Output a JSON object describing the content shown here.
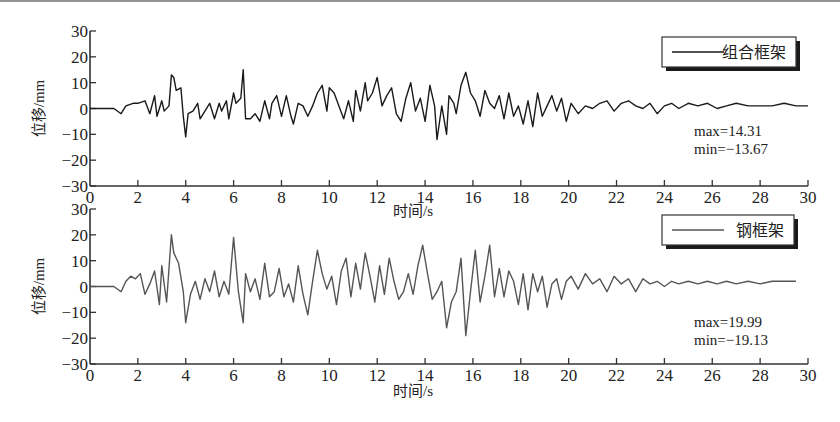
{
  "chart_data": [
    {
      "type": "line",
      "title": "",
      "legend": [
        "组合框架"
      ],
      "legend_position": "upper right",
      "xlabel": "时间/s",
      "ylabel": "位移/mm",
      "xlim": [
        0,
        30
      ],
      "ylim": [
        -30,
        30
      ],
      "xticks": [
        0,
        2,
        4,
        6,
        8,
        10,
        12,
        14,
        16,
        18,
        20,
        22,
        24,
        26,
        28,
        30
      ],
      "yticks": [
        -30,
        -20,
        -10,
        0,
        10,
        20,
        30
      ],
      "grid": false,
      "annotations": [
        "max=14.31",
        "min=-13.67"
      ],
      "series": [
        {
          "name": "组合框架",
          "color": "#1a1a1a",
          "x": [
            0,
            0.5,
            1.0,
            1.3,
            1.5,
            1.8,
            2.0,
            2.3,
            2.5,
            2.7,
            2.8,
            3.0,
            3.1,
            3.3,
            3.4,
            3.5,
            3.6,
            3.8,
            3.9,
            4.0,
            4.1,
            4.3,
            4.5,
            4.6,
            4.8,
            5.0,
            5.2,
            5.4,
            5.5,
            5.7,
            5.8,
            6.0,
            6.1,
            6.3,
            6.4,
            6.5,
            6.7,
            6.9,
            7.1,
            7.3,
            7.5,
            7.6,
            7.8,
            8.0,
            8.2,
            8.4,
            8.5,
            8.7,
            8.9,
            9.1,
            9.3,
            9.5,
            9.7,
            9.9,
            10.0,
            10.2,
            10.4,
            10.6,
            10.8,
            11.0,
            11.1,
            11.3,
            11.5,
            11.6,
            11.8,
            12.0,
            12.2,
            12.4,
            12.6,
            12.8,
            13.0,
            13.2,
            13.4,
            13.6,
            13.8,
            14.0,
            14.2,
            14.4,
            14.5,
            14.7,
            14.9,
            15.0,
            15.2,
            15.3,
            15.5,
            15.7,
            15.9,
            16.1,
            16.3,
            16.5,
            16.7,
            16.9,
            17.1,
            17.3,
            17.5,
            17.7,
            17.9,
            18.1,
            18.3,
            18.5,
            18.7,
            18.9,
            19.1,
            19.3,
            19.5,
            19.7,
            19.9,
            20.1,
            20.4,
            20.7,
            21.0,
            21.3,
            21.6,
            21.9,
            22.2,
            22.5,
            22.8,
            23.1,
            23.4,
            23.7,
            24.0,
            24.3,
            24.6,
            25.0,
            25.4,
            25.8,
            26.2,
            26.6,
            27.0,
            27.5,
            28.0,
            28.5,
            29.0,
            29.5,
            30.0
          ],
          "y": [
            0,
            0,
            0,
            -2,
            1,
            2,
            2,
            3,
            -2,
            5,
            -3,
            3,
            -1,
            1,
            13,
            12,
            7,
            8,
            -3,
            -11,
            -2,
            -1,
            2,
            -4,
            -1,
            2,
            -4,
            2,
            -1,
            3,
            -4,
            6,
            2,
            4,
            15,
            -4,
            -4,
            -2,
            -5,
            3,
            -4,
            2,
            5,
            -3,
            5,
            -3,
            -6,
            2,
            1,
            -3,
            1,
            6,
            9,
            -1,
            8,
            6,
            1,
            -4,
            3,
            -5,
            7,
            -1,
            10,
            3,
            6,
            12,
            1,
            5,
            8,
            -2,
            -5,
            4,
            10,
            -1,
            4,
            -5,
            9,
            1,
            -12,
            1,
            -10,
            5,
            2,
            -2,
            9,
            14,
            6,
            3,
            -3,
            7,
            2,
            0,
            5,
            -4,
            6,
            -3,
            1,
            -6,
            3,
            -7,
            6,
            -3,
            1,
            5,
            -1,
            4,
            -5,
            2,
            -2,
            1,
            0,
            2,
            3,
            -1,
            2,
            3,
            1,
            0,
            2,
            -2,
            1,
            2,
            0,
            2,
            1,
            2,
            0,
            1,
            2,
            1,
            1,
            1,
            2,
            1,
            1,
            2,
            2
          ]
        }
      ]
    },
    {
      "type": "line",
      "title": "",
      "legend": [
        "钢框架"
      ],
      "legend_position": "upper right",
      "xlabel": "时间/s",
      "ylabel": "位移/mm",
      "xlim": [
        0,
        30
      ],
      "ylim": [
        -30,
        30
      ],
      "xticks": [
        0,
        2,
        4,
        6,
        8,
        10,
        12,
        14,
        16,
        18,
        20,
        22,
        24,
        26,
        28,
        30
      ],
      "yticks": [
        -30,
        -20,
        -10,
        0,
        10,
        20,
        30
      ],
      "grid": false,
      "annotations": [
        "max=19.99",
        "min=-19.13"
      ],
      "series": [
        {
          "name": "钢框架",
          "color": "#555555",
          "x": [
            0,
            0.5,
            1.0,
            1.3,
            1.5,
            1.7,
            1.9,
            2.1,
            2.3,
            2.5,
            2.7,
            2.9,
            3.0,
            3.2,
            3.4,
            3.5,
            3.7,
            3.9,
            4.0,
            4.2,
            4.4,
            4.6,
            4.8,
            5.0,
            5.2,
            5.4,
            5.6,
            5.8,
            6.0,
            6.2,
            6.4,
            6.5,
            6.7,
            6.9,
            7.1,
            7.3,
            7.5,
            7.7,
            7.9,
            8.1,
            8.3,
            8.5,
            8.7,
            8.9,
            9.1,
            9.3,
            9.5,
            9.7,
            9.9,
            10.1,
            10.3,
            10.5,
            10.7,
            10.9,
            11.1,
            11.3,
            11.5,
            11.7,
            11.9,
            12.1,
            12.3,
            12.5,
            12.7,
            12.9,
            13.1,
            13.3,
            13.5,
            13.7,
            13.9,
            14.1,
            14.3,
            14.5,
            14.7,
            14.9,
            15.1,
            15.3,
            15.5,
            15.7,
            15.9,
            16.1,
            16.3,
            16.5,
            16.7,
            16.9,
            17.1,
            17.3,
            17.5,
            17.7,
            17.9,
            18.1,
            18.3,
            18.5,
            18.7,
            18.9,
            19.1,
            19.3,
            19.5,
            19.7,
            19.9,
            20.1,
            20.4,
            20.7,
            21.0,
            21.3,
            21.6,
            21.9,
            22.2,
            22.5,
            22.8,
            23.1,
            23.4,
            23.7,
            24.0,
            24.3,
            24.6,
            25.0,
            25.4,
            25.8,
            26.2,
            26.6,
            27.0,
            27.5,
            28.0,
            28.5,
            29.0,
            29.5,
            30.0
          ],
          "y": [
            0,
            0,
            0,
            -2,
            2,
            4,
            3,
            5,
            -3,
            1,
            6,
            -7,
            8,
            -6,
            20,
            13,
            9,
            -2,
            -14,
            -3,
            2,
            -5,
            3,
            -2,
            6,
            -4,
            2,
            -3,
            19,
            -2,
            -14,
            5,
            -2,
            3,
            -5,
            9,
            -4,
            -2,
            7,
            -4,
            1,
            -6,
            8,
            -3,
            -11,
            2,
            14,
            5,
            -1,
            4,
            -7,
            6,
            11,
            -4,
            9,
            -1,
            13,
            4,
            -6,
            8,
            -3,
            11,
            2,
            -5,
            -2,
            5,
            -3,
            8,
            16,
            5,
            -5,
            -2,
            2,
            -16,
            -6,
            -2,
            11,
            -19,
            -2,
            14,
            -6,
            4,
            16,
            -4,
            7,
            -4,
            6,
            2,
            -7,
            5,
            -9,
            5,
            -2,
            4,
            -8,
            1,
            3,
            -5,
            2,
            4,
            -1,
            5,
            1,
            3,
            -2,
            4,
            1,
            3,
            -2,
            3,
            1,
            2,
            0,
            2,
            1,
            2,
            1,
            2,
            1,
            2,
            1,
            2,
            1,
            2,
            2,
            2
          ]
        }
      ]
    }
  ]
}
